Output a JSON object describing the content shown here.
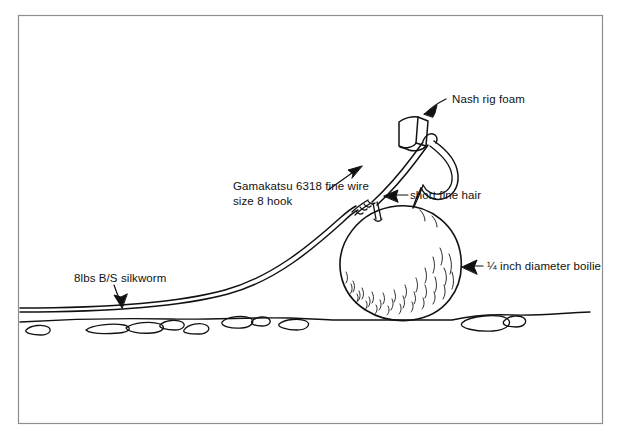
{
  "figure": {
    "kind": "line-drawing",
    "frame": {
      "stroke": "#8c8c8c",
      "fill": "#ffffff"
    },
    "ink": "#111111",
    "background": "#ffffff"
  },
  "labels": {
    "nash_rig_foam": "Nash rig foam",
    "hook": "Gamakatsu 6318 fine wire size 8 hook",
    "hook_line1": "Gamakatsu 6318 fine wire",
    "hook_line2": "size 8 hook",
    "short_fine_hair": "short fine hair",
    "boilie": "¼ inch diameter boilie",
    "silkworm": "8lbs B/S silkworm"
  },
  "annotations": [
    {
      "name": "nash-rig-foam",
      "text": "Nash rig foam",
      "arrow": "points-down-left-to-foam"
    },
    {
      "name": "gamakatsu-hook",
      "text": "Gamakatsu 6318 fine wire size 8 hook",
      "arrow": "points-up-right-to-hook-shank"
    },
    {
      "name": "short-fine-hair",
      "text": "short fine hair",
      "arrow": "points-left-to-hair"
    },
    {
      "name": "boilie",
      "text": "¼ inch diameter boilie",
      "arrow": "points-left-to-bait-ball"
    },
    {
      "name": "silkworm-line",
      "text": "8lbs B/S silkworm",
      "arrow": "points-down-to-mainline"
    }
  ],
  "parts": [
    {
      "name": "hook",
      "description": "fine wire hook with curved bend and point"
    },
    {
      "name": "rig-foam",
      "description": "small foam block on hook shank"
    },
    {
      "name": "knot",
      "description": "whipping knot / hair rig knot at hook eye"
    },
    {
      "name": "hair",
      "description": "short fine hair linking bait to hook"
    },
    {
      "name": "boilie",
      "description": "round textured bait ball"
    },
    {
      "name": "mainline",
      "description": "silkworm hook link lying along lake bed"
    },
    {
      "name": "lake-bed",
      "description": "gravel bottom with pebbles"
    }
  ]
}
